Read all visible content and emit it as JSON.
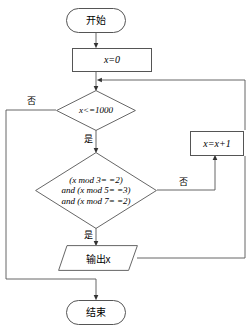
{
  "diagram": {
    "type": "flowchart",
    "stroke_color": "#555555",
    "text_color": "#000000",
    "background": "#ffffff",
    "nodes": [
      {
        "id": "start",
        "shape": "terminator",
        "label": "开始"
      },
      {
        "id": "init",
        "shape": "process",
        "label": "x=0"
      },
      {
        "id": "cond1",
        "shape": "decision",
        "label": "x<=1000"
      },
      {
        "id": "cond2",
        "shape": "decision",
        "line1": "(x mod 3= =2)",
        "line2": "and (x mod 5= =3)",
        "line3": "and (x mod 7= =2)"
      },
      {
        "id": "output",
        "shape": "parallelogram",
        "label": "输出x"
      },
      {
        "id": "incr",
        "shape": "process",
        "label": "x=x+1"
      },
      {
        "id": "end",
        "shape": "terminator",
        "label": "结束"
      }
    ],
    "edge_labels": {
      "cond1_no": "否",
      "cond1_yes": "是",
      "cond2_no": "否",
      "cond2_yes": "是"
    }
  }
}
